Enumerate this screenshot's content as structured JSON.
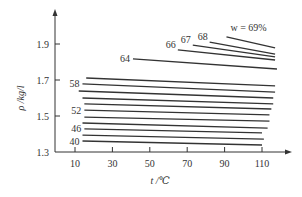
{
  "chart_data": {
    "type": "line",
    "title": "",
    "xlabel": "t /℃",
    "ylabel": "ρ /kg/l",
    "xlim": [
      0,
      125
    ],
    "ylim": [
      1.3,
      2.0
    ],
    "x_ticks": [
      10,
      30,
      50,
      70,
      90,
      110
    ],
    "y_ticks": [
      1.3,
      1.5,
      1.7,
      1.9
    ],
    "grid": false,
    "legend": null,
    "annotation_prefix": "w = ",
    "annotation_suffix": "%",
    "series": [
      {
        "name": "40",
        "label": "40",
        "labeled": true,
        "x": [
          14,
          110
        ],
        "values": [
          1.361,
          1.339
        ]
      },
      {
        "name": "43",
        "label": "",
        "labeled": false,
        "x": [
          14,
          111
        ],
        "values": [
          1.394,
          1.372
        ]
      },
      {
        "name": "46",
        "label": "46",
        "labeled": true,
        "x": [
          15,
          110
        ],
        "values": [
          1.428,
          1.406
        ]
      },
      {
        "name": "49",
        "label": "",
        "labeled": false,
        "x": [
          14,
          113
        ],
        "values": [
          1.461,
          1.433
        ]
      },
      {
        "name": "50",
        "label": "",
        "labeled": false,
        "x": [
          15,
          114
        ],
        "values": [
          1.494,
          1.472
        ]
      },
      {
        "name": "52",
        "label": "52",
        "labeled": true,
        "x": [
          15,
          114
        ],
        "values": [
          1.533,
          1.506
        ]
      },
      {
        "name": "54",
        "label": "",
        "labeled": false,
        "x": [
          15,
          115
        ],
        "values": [
          1.567,
          1.539
        ]
      },
      {
        "name": "56",
        "label": "",
        "labeled": false,
        "x": [
          14,
          116
        ],
        "values": [
          1.6,
          1.567
        ]
      },
      {
        "name": "57",
        "label": "",
        "labeled": false,
        "x": [
          12,
          116
        ],
        "values": [
          1.639,
          1.6
        ]
      },
      {
        "name": "58",
        "label": "58",
        "labeled": true,
        "x": [
          14,
          117
        ],
        "values": [
          1.678,
          1.633
        ]
      },
      {
        "name": "60",
        "label": "",
        "labeled": false,
        "x": [
          16,
          117
        ],
        "values": [
          1.711,
          1.667
        ]
      },
      {
        "name": "64",
        "label": "64",
        "labeled": true,
        "x": [
          41,
          118
        ],
        "values": [
          1.817,
          1.761
        ]
      },
      {
        "name": "66",
        "label": "66",
        "labeled": true,
        "x": [
          65,
          117
        ],
        "values": [
          1.867,
          1.811
        ]
      },
      {
        "name": "67",
        "label": "67",
        "labeled": true,
        "x": [
          73,
          117
        ],
        "values": [
          1.894,
          1.828
        ]
      },
      {
        "name": "68",
        "label": "68",
        "labeled": true,
        "x": [
          82,
          117
        ],
        "values": [
          1.911,
          1.844
        ]
      },
      {
        "name": "69",
        "label": "w = 69%",
        "labeled": true,
        "x": [
          91,
          117
        ],
        "values": [
          1.939,
          1.878
        ]
      }
    ]
  }
}
